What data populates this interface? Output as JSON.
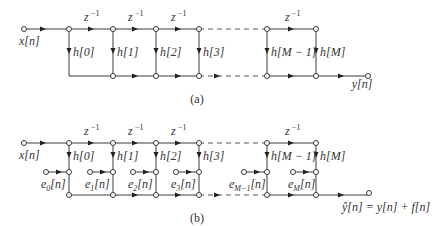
{
  "diagram": {
    "type": "signal-flow-graph",
    "part_a": {
      "caption": "(a)",
      "input_label": "x[n]",
      "output_label": "y[n]",
      "delay_label": "z",
      "delay_exponent": "−1",
      "coefficients": [
        "h[0]",
        "h[1]",
        "h[2]",
        "h[3]",
        "h[M − 1]",
        "h[M]"
      ]
    },
    "part_b": {
      "caption": "(b)",
      "input_label": "x[n]",
      "output_label": "ŷ[n] = y[n] + f[n]",
      "delay_label": "z",
      "delay_exponent": "−1",
      "coefficients": [
        "h[0]",
        "h[1]",
        "h[2]",
        "h[3]",
        "h[M − 1]",
        "h[M]"
      ],
      "error_sources": [
        {
          "base": "e",
          "sub": "0",
          "suffix": "[n]"
        },
        {
          "base": "e",
          "sub": "1",
          "suffix": "[n]"
        },
        {
          "base": "e",
          "sub": "2",
          "suffix": "[n]"
        },
        {
          "base": "e",
          "sub": "3",
          "suffix": "[n]"
        },
        {
          "base": "e",
          "sub": "M−1",
          "suffix": "[n]"
        },
        {
          "base": "e",
          "sub": "M",
          "suffix": "[n]"
        }
      ]
    }
  }
}
